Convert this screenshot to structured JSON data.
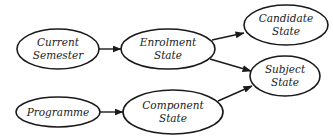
{
  "diagram": {
    "nodes": [
      {
        "id": "current_semester",
        "lines": [
          "Current",
          "Semester"
        ],
        "cx": 58,
        "cy": 49,
        "rx": 41,
        "ry": 20
      },
      {
        "id": "enrolment_state",
        "lines": [
          "Enrolment",
          "State"
        ],
        "cx": 168,
        "cy": 49,
        "rx": 47,
        "ry": 20
      },
      {
        "id": "candidate_state",
        "lines": [
          "Candidate",
          "State"
        ],
        "cx": 286,
        "cy": 25,
        "rx": 42,
        "ry": 20
      },
      {
        "id": "subject_state",
        "lines": [
          "Subject",
          "State"
        ],
        "cx": 285,
        "cy": 76,
        "rx": 35,
        "ry": 20
      },
      {
        "id": "programme",
        "lines": [
          "Programme"
        ],
        "cx": 58,
        "cy": 112,
        "rx": 42,
        "ry": 15
      },
      {
        "id": "component_state",
        "lines": [
          "Component",
          "State"
        ],
        "cx": 173,
        "cy": 112,
        "rx": 50,
        "ry": 22
      }
    ],
    "edges": [
      {
        "from": "current_semester",
        "to": "enrolment_state",
        "x1": 99,
        "y1": 49,
        "x2": 121,
        "y2": 49
      },
      {
        "from": "enrolment_state",
        "to": "candidate_state",
        "x1": 212,
        "y1": 40,
        "x2": 244,
        "y2": 33
      },
      {
        "from": "enrolment_state",
        "to": "subject_state",
        "x1": 210,
        "y1": 59,
        "x2": 251,
        "y2": 71
      },
      {
        "from": "programme",
        "to": "component_state",
        "x1": 100,
        "y1": 112,
        "x2": 123,
        "y2": 112
      },
      {
        "from": "component_state",
        "to": "subject_state",
        "x1": 218,
        "y1": 101,
        "x2": 252,
        "y2": 86
      }
    ]
  }
}
